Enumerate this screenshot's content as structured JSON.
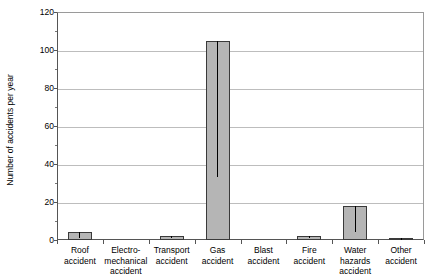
{
  "chart_data": {
    "type": "bar",
    "title": "",
    "xlabel": "",
    "ylabel": "Number of accidents per year",
    "ylim": [
      0,
      120
    ],
    "yticks": [
      0,
      20,
      40,
      60,
      80,
      100,
      120
    ],
    "ytick_labels": [
      "0",
      "20",
      "40",
      "60",
      "80",
      "100",
      "120"
    ],
    "grid": true,
    "legend": false,
    "bar_color": "#b5b5b5",
    "bar_edge_color": "#3a3a3a",
    "error_bar_color": "#000000",
    "gridline_color": "#bdbdbd",
    "axis_color": "#555555",
    "categories": [
      "Roof\naccident",
      "Electro-\nmechanical\naccident",
      "Transport\naccident",
      "Gas\naccident",
      "Blast\naccident",
      "Fire\naccident",
      "Water\nhazards\naccident",
      "Other\naccident"
    ],
    "values": [
      4,
      0,
      2,
      105,
      0,
      2,
      18,
      1
    ],
    "error_low": [
      1,
      0,
      1,
      33,
      0,
      1,
      4,
      0
    ],
    "error_high": [
      4,
      0,
      2,
      105,
      0,
      2,
      18,
      1
    ]
  }
}
